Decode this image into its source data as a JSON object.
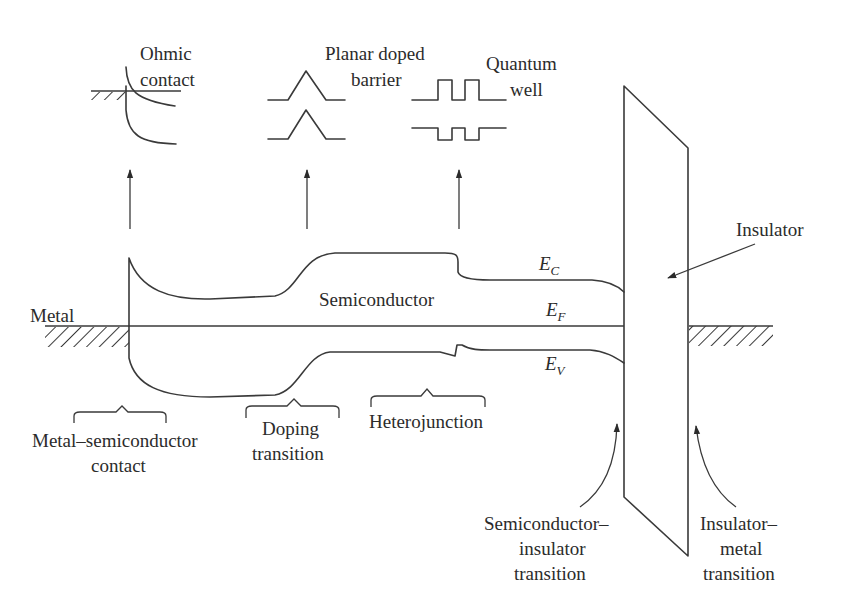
{
  "figure": {
    "insets": {
      "ohmic": [
        "Ohmic",
        "contact"
      ],
      "planar": [
        "Planar doped",
        "barrier"
      ],
      "quantum": [
        "Quantum",
        "well"
      ]
    },
    "regions": {
      "metal_left": "Metal",
      "semiconductor": "Semiconductor",
      "insulator": "Insulator"
    },
    "bands": {
      "ec": {
        "main": "E",
        "sub": "C"
      },
      "ef": {
        "main": "E",
        "sub": "F"
      },
      "ev": {
        "main": "E",
        "sub": "V"
      }
    },
    "transitions": {
      "metal_semi": [
        "Metal–semiconductor",
        "contact"
      ],
      "doping": [
        "Doping",
        "transition"
      ],
      "hetero": [
        "Heterojunction"
      ],
      "semi_ins": [
        "Semiconductor–",
        "insulator",
        "transition"
      ],
      "ins_metal": [
        "Insulator–",
        "metal",
        "transition"
      ]
    },
    "colors": {
      "line": "#3a3a3a",
      "text": "#2b2b2b",
      "background": "#ffffff"
    }
  }
}
